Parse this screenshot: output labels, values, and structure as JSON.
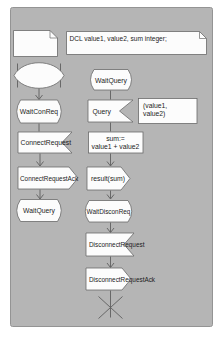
{
  "colors": {
    "page_bg": "#ffffff",
    "panel_bg": "#b5b5b5",
    "panel_border": "#949494",
    "symbol_fill": "#fcfcfc",
    "symbol_stroke": "#6a6a6a",
    "text": "#1c1c1c"
  },
  "declaration_box": {
    "text": "DCL value1, value2, sum integer;"
  },
  "left_flow": {
    "state_wait_con_req": "WaitConReq",
    "input_connect_request": "ConnectRequest",
    "output_connect_request_ack": "ConnectRequestAck",
    "state_wait_query": "WaitQuery"
  },
  "right_flow": {
    "state_wait_query": "WaitQuery",
    "input_query": "Query",
    "query_args": {
      "line1": "(value1,",
      "line2": "value2)"
    },
    "task_sum": {
      "line1": "sum:=",
      "line2": "value1 + value2"
    },
    "output_result": "result(sum)",
    "state_wait_discon_req": "WaitDisconReq",
    "input_disconnect_request": "DisconnectRequest",
    "output_disconnect_request_ack": "DisconnectRequestAck"
  }
}
